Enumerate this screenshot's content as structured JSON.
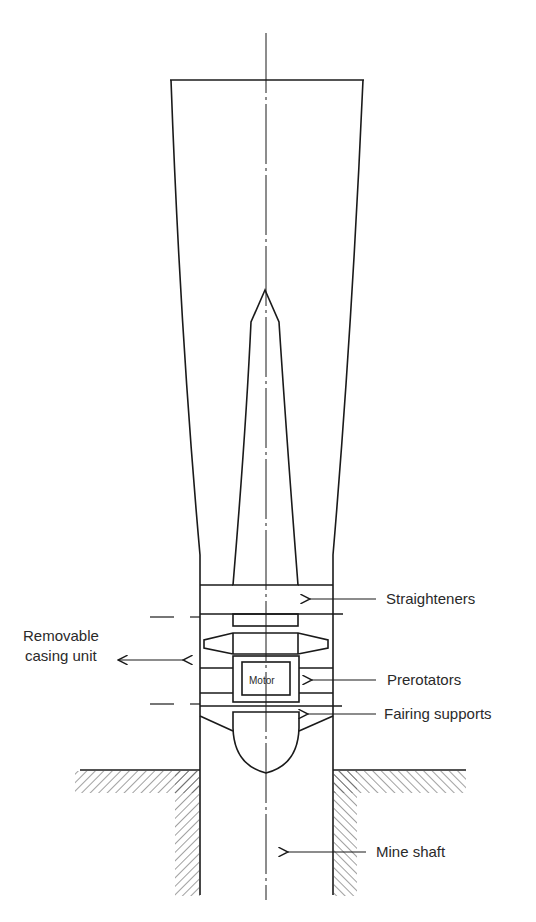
{
  "diagram": {
    "type": "fan installation cross-section",
    "labels": {
      "straighteners": "Straighteners",
      "removable_casing_line1": "Removable",
      "removable_casing_line2": "casing unit",
      "prerotators": "Prerotators",
      "fairing_supports": "Fairing supports",
      "mine_shaft": "Mine shaft",
      "motor": "Motor"
    },
    "colors": {
      "line": "#1a1a1a",
      "text": "#2a2a2a",
      "background": "#ffffff"
    }
  }
}
